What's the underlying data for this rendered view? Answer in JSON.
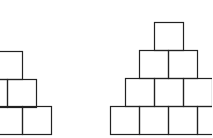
{
  "diagram": {
    "box_size": 29,
    "stroke_color": "#222222",
    "background": "#ffffff",
    "pyramids": [
      {
        "name": "left-pyramid",
        "rows": [
          {
            "y": 51,
            "boxes_x": [
              -7
            ]
          },
          {
            "y": 79,
            "boxes_x": [
              -22,
              7
            ]
          },
          {
            "y": 106,
            "boxes_x": [
              -7,
              22
            ]
          }
        ]
      },
      {
        "name": "right-pyramid",
        "rows": [
          {
            "y": 22,
            "boxes_x": [
              154
            ]
          },
          {
            "y": 50,
            "boxes_x": [
              139,
              168
            ]
          },
          {
            "y": 78,
            "boxes_x": [
              125,
              154,
              183
            ]
          },
          {
            "y": 106,
            "boxes_x": [
              110,
              139,
              168,
              197
            ]
          }
        ]
      }
    ]
  }
}
